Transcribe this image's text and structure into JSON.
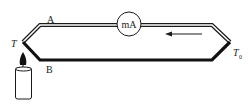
{
  "diagram": {
    "labels": {
      "wire_a": "A",
      "wire_b": "B",
      "hot_junction": "T",
      "cold_junction": "T",
      "cold_junction_subscript": "0",
      "meter": "mA"
    },
    "elements": {
      "meter": "milliammeter",
      "heat_source": "candle",
      "current_direction": "right-to-left (along wire A)"
    },
    "colors": {
      "line": "#1a1a1a",
      "background": "#ffffff"
    }
  }
}
